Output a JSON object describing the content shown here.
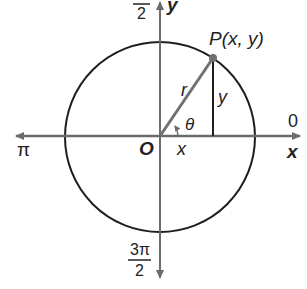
{
  "diagram": {
    "type": "unit-circle",
    "labels": {
      "point": "P(x, y)",
      "radius": "r",
      "opposite": "y",
      "adjacent": "x",
      "angle": "θ",
      "origin": "O",
      "x_axis": "x",
      "y_axis": "y",
      "angle_0": "0",
      "angle_pi": "π",
      "angle_pi_over_2_numer": "π",
      "angle_pi_over_2_denom": "2",
      "angle_3pi_over_2_numer": "3π",
      "angle_3pi_over_2_denom": "2"
    },
    "colors": {
      "axis": "#6b6b6b",
      "circle": "#1e1e1e",
      "radius": "#707070",
      "text": "#222222"
    }
  }
}
